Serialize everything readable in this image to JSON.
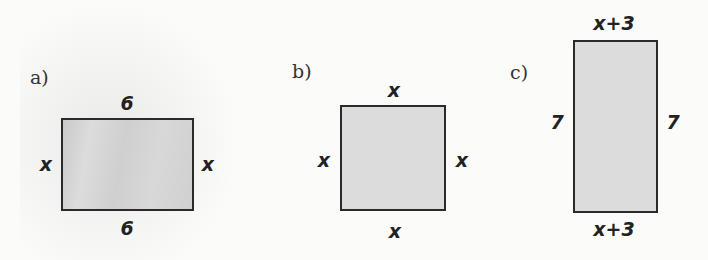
{
  "figures": [
    {
      "label": "a)",
      "shape": "rectangle",
      "top": "6",
      "bottom": "6",
      "left": "x",
      "right": "x"
    },
    {
      "label": "b)",
      "shape": "square",
      "top": "x",
      "bottom": "x",
      "left": "x",
      "right": "x"
    },
    {
      "label": "c)",
      "shape": "rectangle",
      "top": "x+3",
      "bottom": "x+3",
      "left": "7",
      "right": "7"
    }
  ],
  "colors": {
    "fill": "#dcdcdc",
    "stroke": "#2a2a2a",
    "background": "#fbfbfa"
  }
}
